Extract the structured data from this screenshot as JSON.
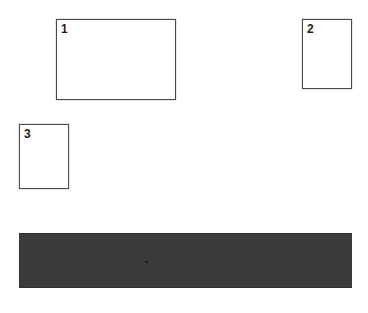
{
  "page": {
    "background_color": "#ffffff",
    "width": 368,
    "height": 313
  },
  "regions": [
    {
      "label": "1",
      "name": "region-1",
      "orientation": "landscape",
      "x": 56,
      "y": 19,
      "width": 120,
      "height": 81,
      "border_color": "#4a4a4a",
      "fill_color": "#ffffff"
    },
    {
      "label": "2",
      "name": "region-2",
      "orientation": "portrait",
      "x": 302,
      "y": 19,
      "width": 50,
      "height": 70,
      "border_color": "#4a4a4a",
      "fill_color": "#ffffff"
    },
    {
      "label": "3",
      "name": "region-3",
      "orientation": "portrait",
      "x": 19,
      "y": 124,
      "width": 50,
      "height": 65,
      "border_color": "#4a4a4a",
      "fill_color": "#ffffff"
    }
  ],
  "band": {
    "name": "dark-band",
    "x": 19,
    "y": 233,
    "width": 333,
    "height": 55,
    "fill_color": "#3b3b3b",
    "edge_color": "#2f2f2f",
    "texture": "grain",
    "speck": {
      "x": 126,
      "y": 27
    }
  }
}
